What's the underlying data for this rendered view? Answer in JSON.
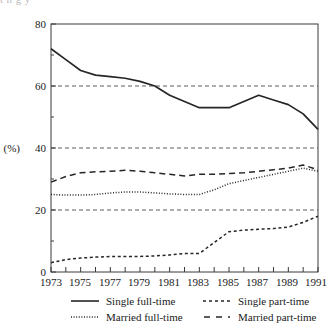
{
  "ghost_text": "t                 n                 g              y",
  "chart_data": {
    "type": "line",
    "title": "",
    "subtitle": "",
    "xlabel": "",
    "ylabel": "(%)",
    "ylim": [
      0,
      80
    ],
    "xlim": [
      1973,
      1991
    ],
    "yticks": [
      0,
      20,
      40,
      60,
      80
    ],
    "ytick_labels": [
      "0",
      "20",
      "40",
      "60",
      "80"
    ],
    "minor_yticks": [
      10,
      30,
      50,
      70
    ],
    "gridlines": [
      20,
      40,
      60
    ],
    "grid": true,
    "grid_style": "dashed",
    "x": [
      1973,
      1974,
      1975,
      1976,
      1977,
      1978,
      1979,
      1980,
      1981,
      1982,
      1983,
      1984,
      1985,
      1986,
      1987,
      1988,
      1989,
      1990,
      1991
    ],
    "xticks": [
      1973,
      1974,
      1975,
      1976,
      1977,
      1978,
      1979,
      1980,
      1981,
      1982,
      1983,
      1984,
      1985,
      1986,
      1987,
      1988,
      1989,
      1990,
      1991
    ],
    "xtick_labels": [
      "1973",
      "1975",
      "1977",
      "1979",
      "1981",
      "1983",
      "1985",
      "1987",
      "1989",
      "1991"
    ],
    "xtick_labels_years": [
      1973,
      1975,
      1977,
      1979,
      1981,
      1983,
      1985,
      1987,
      1989,
      1991
    ],
    "legend_position": "below",
    "series": [
      {
        "name": "Single full-time",
        "style": "solid",
        "color": "#262626",
        "values": [
          72.0,
          68.5,
          65.0,
          63.5,
          63.0,
          62.5,
          61.5,
          60.0,
          57.0,
          55.0,
          53.0,
          53.0,
          53.0,
          55.0,
          57.0,
          55.5,
          54.0,
          51.0,
          46.0
        ]
      },
      {
        "name": "Single part-time",
        "style": "dashed-fine",
        "color": "#262626",
        "values": [
          3.0,
          4.0,
          4.5,
          4.8,
          5.0,
          5.0,
          5.0,
          5.2,
          5.5,
          6.0,
          6.0,
          9.5,
          13.0,
          13.5,
          13.8,
          14.0,
          14.5,
          16.0,
          18.0
        ]
      },
      {
        "name": "Married full-time",
        "style": "dotted",
        "color": "#262626",
        "values": [
          25.0,
          24.8,
          24.8,
          25.0,
          25.5,
          25.8,
          25.8,
          25.5,
          25.2,
          25.0,
          25.0,
          26.5,
          28.5,
          29.5,
          30.5,
          31.5,
          32.5,
          33.5,
          32.5
        ]
      },
      {
        "name": "Married part-time",
        "style": "dashed",
        "color": "#262626",
        "values": [
          29.0,
          30.8,
          32.0,
          32.3,
          32.5,
          32.8,
          32.5,
          32.0,
          31.5,
          31.0,
          31.5,
          31.5,
          31.8,
          32.0,
          32.5,
          33.0,
          33.5,
          34.5,
          33.0
        ]
      }
    ]
  },
  "legend": {
    "items": [
      {
        "label": "Single full-time",
        "style": "solid"
      },
      {
        "label": "Single part-time",
        "style": "dashed-fine"
      },
      {
        "label": "Married full-time",
        "style": "dotted"
      },
      {
        "label": "Married part-time",
        "style": "dashed"
      }
    ]
  }
}
